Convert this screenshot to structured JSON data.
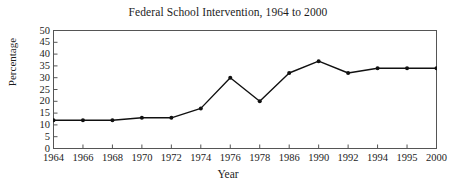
{
  "chart_data": {
    "type": "line",
    "title": "Federal School Intervention, 1964 to 2000",
    "xlabel": "Year",
    "ylabel": "Percentage",
    "categories": [
      "1964",
      "1966",
      "1968",
      "1970",
      "1972",
      "1974",
      "1976",
      "1978",
      "1986",
      "1990",
      "1992",
      "1994",
      "1995",
      "2000"
    ],
    "values": [
      12,
      12,
      12,
      13,
      13,
      17,
      30,
      20,
      32,
      37,
      32,
      34,
      34,
      34
    ],
    "ylim": [
      0,
      50
    ],
    "ytick_labels": [
      "50",
      "45",
      "40",
      "35",
      "30",
      "25",
      "20",
      "15",
      "10",
      "5",
      "0"
    ],
    "ytick_values": [
      50,
      45,
      40,
      35,
      30,
      25,
      20,
      15,
      10,
      5,
      0
    ],
    "grid": false,
    "legend": "none",
    "line_color": "#111111",
    "marker_color": "#111111",
    "frame_color": "#555555",
    "background": "#ffffff"
  }
}
